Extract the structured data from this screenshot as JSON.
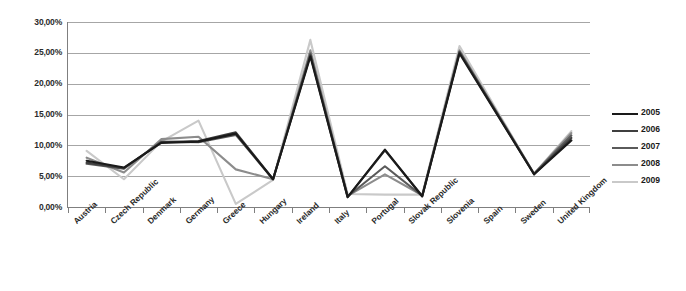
{
  "chart_data": {
    "type": "line",
    "title": "",
    "subtitle": "",
    "xlabel": "",
    "ylabel": "",
    "ylim": [
      0,
      30
    ],
    "grid": true,
    "legend_position": "right",
    "y_tick_labels": [
      "30,00%",
      "25,00%",
      "20,00%",
      "15,00%",
      "10,00%",
      "5,00%",
      "0,00%"
    ],
    "y_tick_values": [
      30,
      25,
      20,
      15,
      10,
      5,
      0
    ],
    "categories": [
      "Austria",
      "Czech Republic",
      "Denmark",
      "Germany",
      "Greece",
      "Hungary",
      "Ireland",
      "Italy",
      "Portugal",
      "Slovak Republic",
      "Slovenia",
      "Spain",
      "Sweden",
      "United Kingdom"
    ],
    "series": [
      {
        "name": "2005",
        "color": "#1a1a1a",
        "values": [
          7.5,
          6.4,
          10.4,
          10.6,
          11.9,
          4.5,
          24.4,
          1.6,
          9.3,
          1.7,
          24.9,
          15.1,
          5.3,
          10.8
        ]
      },
      {
        "name": "2006",
        "color": "#3f3f3f",
        "values": [
          7.2,
          6.3,
          10.5,
          10.7,
          12.1,
          4.5,
          24.6,
          1.6,
          9.2,
          1.8,
          25.1,
          15.2,
          5.3,
          11.2
        ]
      },
      {
        "name": "2007",
        "color": "#5a5a5a",
        "values": [
          7.0,
          6.2,
          10.6,
          10.5,
          11.7,
          4.5,
          24.9,
          1.7,
          6.6,
          1.8,
          25.2,
          15.3,
          5.4,
          11.6
        ]
      },
      {
        "name": "2008",
        "color": "#8c8c8c",
        "values": [
          8.0,
          5.6,
          11.0,
          11.4,
          6.1,
          4.5,
          25.4,
          1.8,
          5.3,
          1.9,
          25.4,
          15.4,
          5.4,
          12.0
        ]
      },
      {
        "name": "2009",
        "color": "#c9c9c9",
        "values": [
          9.1,
          4.5,
          10.6,
          14.0,
          0.5,
          4.4,
          27.1,
          2.1,
          2.0,
          2.0,
          26.1,
          15.7,
          5.4,
          12.3
        ]
      }
    ]
  },
  "legend": {
    "entries": [
      {
        "label": "2005",
        "color": "#1a1a1a"
      },
      {
        "label": "2006",
        "color": "#3f3f3f"
      },
      {
        "label": "2007",
        "color": "#5a5a5a"
      },
      {
        "label": "2008",
        "color": "#8c8c8c"
      },
      {
        "label": "2009",
        "color": "#c9c9c9"
      }
    ]
  }
}
